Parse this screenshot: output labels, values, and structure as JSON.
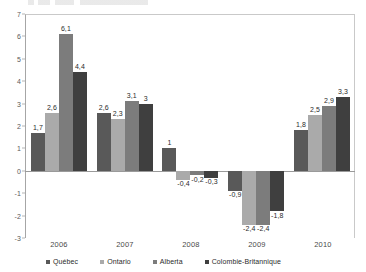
{
  "chart_data": {
    "type": "bar",
    "title": "",
    "xlabel": "",
    "ylabel": "",
    "categories": [
      "2006",
      "2007",
      "2008",
      "2009",
      "2010"
    ],
    "ylim": [
      -3,
      7
    ],
    "yticks": [
      7,
      6,
      5,
      4,
      3,
      2,
      1,
      0,
      -1,
      -2,
      -3
    ],
    "ytick_labels": [
      "7",
      "6",
      "5",
      "4",
      "3",
      "2",
      "1",
      "0",
      "-1",
      "-2",
      "-3"
    ],
    "grid": false,
    "legend_position": "bottom",
    "decimal_separator": ",",
    "series": [
      {
        "name": "Québec",
        "color": "#595959",
        "values": [
          1.7,
          2.6,
          1.0,
          -0.9,
          1.8
        ],
        "labels": [
          "1,7",
          "2,6",
          "1",
          "-0,9",
          "1,8"
        ]
      },
      {
        "name": "Ontario",
        "color": "#aaaaaa",
        "values": [
          2.6,
          2.3,
          -0.4,
          -2.4,
          2.5
        ],
        "labels": [
          "2,6",
          "2,3",
          "-0,4",
          "-2,4",
          "2,5"
        ]
      },
      {
        "name": "Alberta",
        "color": "#7c7c7c",
        "values": [
          6.1,
          3.1,
          -0.2,
          -2.4,
          2.9
        ],
        "labels": [
          "6,1",
          "3,1",
          "-0,2",
          "-2,4",
          "2,9"
        ]
      },
      {
        "name": "Colombie-Britannique",
        "color": "#3f3f3f",
        "values": [
          4.4,
          3.0,
          -0.3,
          -1.8,
          3.3
        ],
        "labels": [
          "4,4",
          "3",
          "-0,3",
          "-1,8",
          "3,3"
        ]
      }
    ]
  },
  "axis": {
    "y_label_color": "#5a5a5a",
    "x_label_color": "#4a4a4a"
  }
}
